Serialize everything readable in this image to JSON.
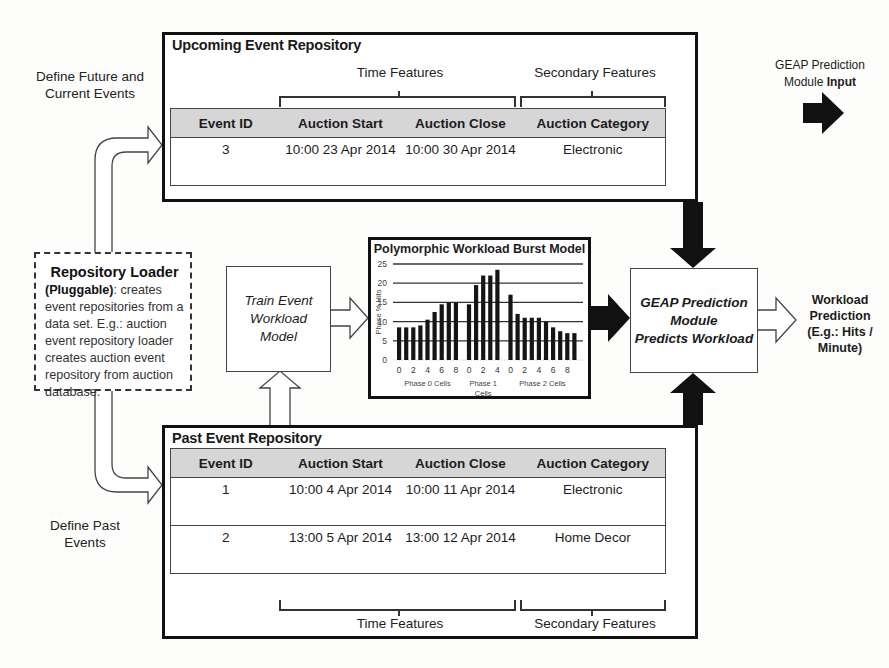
{
  "upcoming_repo": {
    "title": "Upcoming Event Repository",
    "time_features_label": "Time Features",
    "secondary_features_label": "Secondary Features",
    "columns": [
      "Event ID",
      "Auction Start",
      "Auction Close",
      "Auction Category"
    ],
    "rows": [
      {
        "event_id": "3",
        "start": "10:00 23 Apr 2014",
        "close": "10:00 30 Apr 2014",
        "category": "Electronic"
      }
    ]
  },
  "past_repo": {
    "title": "Past Event Repository",
    "time_features_label": "Time Features",
    "secondary_features_label": "Secondary Features",
    "columns": [
      "Event ID",
      "Auction Start",
      "Auction Close",
      "Auction Category"
    ],
    "rows": [
      {
        "event_id": "1",
        "start": "10:00 4 Apr 2014",
        "close": "10:00 11 Apr 2014",
        "category": "Electronic"
      },
      {
        "event_id": "2",
        "start": "13:00 5 Apr 2014",
        "close": "13:00 12 Apr 2014",
        "category": "Home Decor"
      }
    ]
  },
  "labels": {
    "define_future": "Define Future and Current Events",
    "define_past": "Define Past Events",
    "geap_input_line1": "GEAP Prediction",
    "geap_input_line2_plain": "Module ",
    "geap_input_line2_bold": "Input"
  },
  "repository_loader": {
    "title": "Repository Loader",
    "pluggable": "(Pluggable)",
    "description": ": creates event repositories from a data set. E.g.: auction event repository loader creates auction event repository from auction database."
  },
  "train_model": {
    "label": "Train Event Workload Model"
  },
  "geap_module": {
    "line1": "GEAP Prediction",
    "line2": "Module",
    "line3": "Predicts Workload"
  },
  "workload_prediction": {
    "label": "Workload Prediction (E.g.: Hits / Minute)"
  },
  "chart_data": {
    "type": "bar",
    "title": "Polymorphic Workload Burst Model",
    "xlabel": "",
    "ylabel": "Phase % Hits",
    "ylim": [
      0,
      25
    ],
    "yticks": [
      0,
      5,
      10,
      15,
      20,
      25
    ],
    "grid": true,
    "groups": [
      {
        "name": "Phase 0 Cells",
        "x_ticks": [
          "0",
          "2",
          "4",
          "6",
          "8"
        ],
        "values": [
          8.5,
          8.5,
          8.5,
          9,
          10.5,
          12.5,
          14.5,
          15,
          15
        ]
      },
      {
        "name": "Phase 1 Cells",
        "x_ticks": [
          "0",
          "2",
          "4"
        ],
        "values": [
          14.5,
          19.5,
          22,
          22,
          23.5
        ]
      },
      {
        "name": "Phase 2 Cells",
        "x_ticks": [
          "0",
          "2",
          "4",
          "6",
          "8"
        ],
        "values": [
          17,
          12,
          11,
          11,
          11,
          10,
          8.5,
          7.5,
          7,
          7
        ]
      }
    ]
  }
}
